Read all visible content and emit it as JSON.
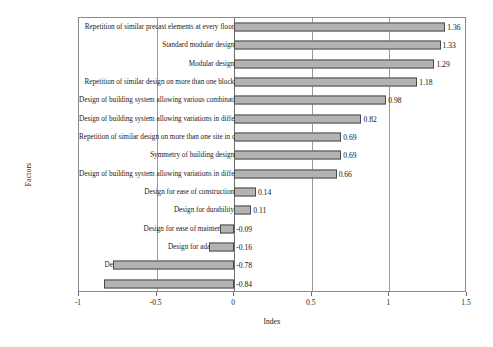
{
  "chart_data": {
    "type": "bar",
    "orientation": "horizontal",
    "title": "",
    "xlabel": "Index",
    "ylabel": "Factors",
    "xlim": [
      -1,
      1.5
    ],
    "xticks": [
      -1,
      -0.5,
      0,
      0.5,
      1,
      1.5
    ],
    "xticklabels": [
      "-1",
      "-0.5",
      "0",
      "0.5",
      "1",
      "1.5"
    ],
    "grid": "vertical gridlines at -0.5, 0, 0.5, 1",
    "legend": "none",
    "bar_color": "#b3b3b3",
    "bar_edge_color": "#4a4a4a",
    "categories": [
      "Repetition of similar precast elements at every floor",
      "Standard modular design",
      "Modular design",
      "Repetition of similar design on more than one block",
      "Design of building system allowing various combination of precast elements",
      "Design of building system allowing variations in different blocks",
      "Repetition of similar design on more than one site in different location",
      "Symmetry of building design",
      "Design of building system allowing variations in different floors",
      "Design for ease of construction",
      "Design for durability",
      "Design for ease of maintenance",
      "Design for adaptability",
      "Design for dismantling for reuse or recycling",
      "Design for recycling"
    ],
    "values": [
      1.36,
      1.33,
      1.29,
      1.18,
      0.98,
      0.82,
      0.69,
      0.69,
      0.66,
      0.14,
      0.11,
      -0.09,
      -0.16,
      -0.78,
      -0.84
    ],
    "value_labels": [
      "1.36",
      "1.33",
      "1.29",
      "1.18",
      "0.98",
      "0.82",
      "0.69",
      "0.69",
      "0.66",
      "0.14",
      "0.11",
      "-0.09",
      "-0.16",
      "-0.78",
      "-0.84"
    ]
  }
}
